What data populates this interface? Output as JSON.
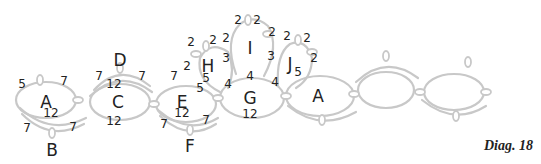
{
  "caption": "Diag. 18",
  "rings": [
    {
      "id": "A",
      "x": 46,
      "y": 102
    },
    {
      "id": "C",
      "x": 118,
      "y": 102
    },
    {
      "id": "E",
      "x": 182,
      "y": 102
    },
    {
      "id": "G",
      "x": 250,
      "y": 98
    },
    {
      "id": "H",
      "x": 208,
      "y": 66
    },
    {
      "id": "I",
      "x": 250,
      "y": 48
    },
    {
      "id": "J",
      "x": 290,
      "y": 64
    },
    {
      "id": "A2",
      "label": "A",
      "x": 318,
      "y": 96
    }
  ],
  "chains": [
    {
      "id": "B",
      "x": 52,
      "y": 150
    },
    {
      "id": "D",
      "x": 120,
      "y": 62
    },
    {
      "id": "F",
      "x": 190,
      "y": 146
    }
  ],
  "counts": [
    {
      "t": "5",
      "x": 22,
      "y": 88
    },
    {
      "t": "7",
      "x": 64,
      "y": 85
    },
    {
      "t": "12",
      "x": 51,
      "y": 117
    },
    {
      "t": "7",
      "x": 27,
      "y": 132
    },
    {
      "t": "7",
      "x": 73,
      "y": 131
    },
    {
      "t": "7",
      "x": 99,
      "y": 80
    },
    {
      "t": "12",
      "x": 114,
      "y": 88
    },
    {
      "t": "7",
      "x": 142,
      "y": 80
    },
    {
      "t": "12",
      "x": 114,
      "y": 125
    },
    {
      "t": "7",
      "x": 174,
      "y": 80
    },
    {
      "t": "5",
      "x": 200,
      "y": 92
    },
    {
      "t": "12",
      "x": 182,
      "y": 117
    },
    {
      "t": "7",
      "x": 164,
      "y": 128
    },
    {
      "t": "7",
      "x": 206,
      "y": 124
    },
    {
      "t": "5",
      "x": 206,
      "y": 82
    },
    {
      "t": "4",
      "x": 228,
      "y": 88
    },
    {
      "t": "4",
      "x": 250,
      "y": 80
    },
    {
      "t": "4",
      "x": 275,
      "y": 86
    },
    {
      "t": "12",
      "x": 250,
      "y": 118
    },
    {
      "t": "2",
      "x": 191,
      "y": 46
    },
    {
      "t": "2",
      "x": 213,
      "y": 44
    },
    {
      "t": "2",
      "x": 226,
      "y": 42
    },
    {
      "t": "2",
      "x": 187,
      "y": 70
    },
    {
      "t": "3",
      "x": 226,
      "y": 62
    },
    {
      "t": "2",
      "x": 238,
      "y": 24
    },
    {
      "t": "2",
      "x": 257,
      "y": 24
    },
    {
      "t": "2",
      "x": 272,
      "y": 36
    },
    {
      "t": "3",
      "x": 271,
      "y": 60
    },
    {
      "t": "2",
      "x": 287,
      "y": 40
    },
    {
      "t": "2",
      "x": 307,
      "y": 42
    },
    {
      "t": "2",
      "x": 314,
      "y": 62
    },
    {
      "t": "5",
      "x": 298,
      "y": 76
    }
  ]
}
